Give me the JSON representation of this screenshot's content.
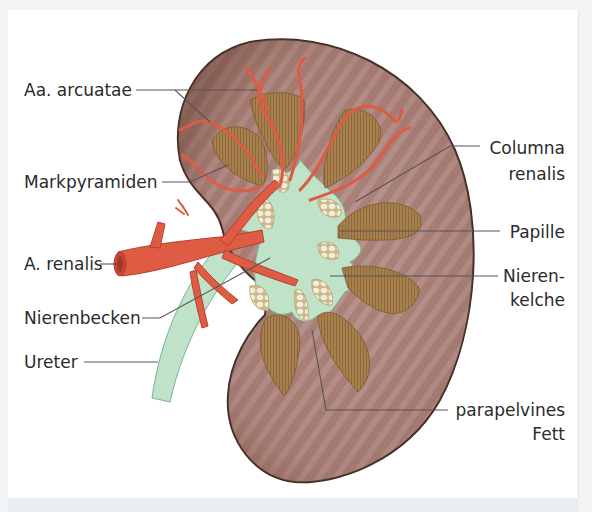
{
  "figure": {
    "colors": {
      "cortex": "#a98077",
      "cortex_stripe": "#c7a4a0",
      "capsule": "#3a2a22",
      "pyramid": "#a7804e",
      "pyramid_line": "#7b5a30",
      "pelvis": "#bfe2c8",
      "pelvis_edge": "#7fb48c",
      "artery": "#de5b44",
      "artery_dark": "#b8402f",
      "fat": "#f1e7cf",
      "fat_edge": "#c9b98d",
      "leader": "#555555",
      "text": "#2b2b2b"
    },
    "labels_left": [
      {
        "id": "aa-arcuatae",
        "text": "Aa. arcuatae"
      },
      {
        "id": "markpyramiden",
        "text": "Markpyramiden"
      },
      {
        "id": "a-renalis",
        "text": "A. renalis"
      },
      {
        "id": "nierenbecken",
        "text": "Nierenbecken"
      },
      {
        "id": "ureter",
        "text": "Ureter"
      }
    ],
    "labels_right": [
      {
        "id": "columna-renalis",
        "lines": [
          "Columna",
          "renalis"
        ]
      },
      {
        "id": "papille",
        "lines": [
          "Papille"
        ]
      },
      {
        "id": "nierenkelche",
        "lines": [
          "Nieren-",
          "kelche"
        ]
      },
      {
        "id": "parapelvines-fett",
        "lines": [
          "parapelvines",
          "Fett"
        ]
      }
    ]
  }
}
